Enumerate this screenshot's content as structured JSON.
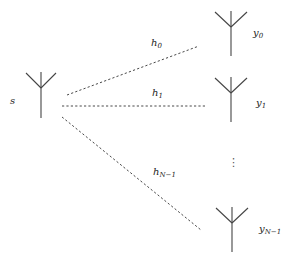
{
  "diagram": {
    "type": "antenna-broadcast",
    "colors": {
      "line": "#333333",
      "antenna": "#444444",
      "text": "#222222",
      "background": "#ffffff"
    },
    "source": {
      "label": "s",
      "icon": "antenna-icon"
    },
    "receivers": [
      {
        "label": "y",
        "subscript": "0",
        "icon": "antenna-icon"
      },
      {
        "label": "y",
        "subscript": "1",
        "icon": "antenna-icon"
      },
      {
        "label": "y",
        "subscript": "N−1",
        "icon": "antenna-icon"
      }
    ],
    "channels": [
      {
        "label": "h",
        "subscript": "0"
      },
      {
        "label": "h",
        "subscript": "1"
      },
      {
        "label": "h",
        "subscript": "N−1"
      }
    ],
    "ellipsis": "⋮"
  }
}
